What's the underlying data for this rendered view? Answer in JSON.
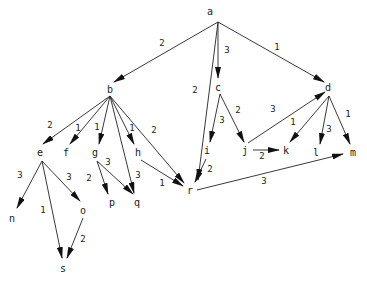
{
  "graph": {
    "type": "directed-weighted-tree",
    "nodes": [
      {
        "id": "a",
        "label": "a",
        "x": 210,
        "y": 12
      },
      {
        "id": "b",
        "label": "b",
        "x": 110,
        "y": 90
      },
      {
        "id": "c",
        "label": "c",
        "x": 218,
        "y": 88
      },
      {
        "id": "d",
        "label": "d",
        "x": 328,
        "y": 88
      },
      {
        "id": "e",
        "label": "e",
        "x": 40,
        "y": 153
      },
      {
        "id": "f",
        "label": "f",
        "x": 66,
        "y": 153
      },
      {
        "id": "g",
        "label": "g",
        "x": 95,
        "y": 153
      },
      {
        "id": "h",
        "label": "h",
        "x": 138,
        "y": 153
      },
      {
        "id": "i",
        "label": "i",
        "x": 207,
        "y": 151
      },
      {
        "id": "j",
        "label": "j",
        "x": 245,
        "y": 151
      },
      {
        "id": "k",
        "label": "k",
        "x": 286,
        "y": 151
      },
      {
        "id": "l",
        "label": "l",
        "x": 316,
        "y": 153
      },
      {
        "id": "m",
        "label": "m",
        "x": 353,
        "y": 153
      },
      {
        "id": "n",
        "label": "n",
        "x": 12,
        "y": 219
      },
      {
        "id": "o",
        "label": "o",
        "x": 83,
        "y": 211
      },
      {
        "id": "p",
        "label": "p",
        "x": 112,
        "y": 203
      },
      {
        "id": "q",
        "label": "q",
        "x": 137,
        "y": 203
      },
      {
        "id": "r",
        "label": "r",
        "x": 190,
        "y": 191
      },
      {
        "id": "s",
        "label": "s",
        "x": 63,
        "y": 269
      }
    ],
    "edges": [
      {
        "from": "a",
        "to": "b",
        "weight": "2",
        "lx": 162,
        "ly": 46,
        "x1": 218,
        "y1": 22,
        "x2": 114,
        "y2": 82
      },
      {
        "from": "a",
        "to": "r",
        "weight": "2",
        "lx": 195,
        "ly": 93,
        "x1": 218,
        "y1": 22,
        "x2": 198,
        "y2": 180
      },
      {
        "from": "a",
        "to": "c",
        "weight": "3",
        "lx": 227,
        "ly": 53,
        "x1": 218,
        "y1": 22,
        "x2": 218,
        "y2": 78
      },
      {
        "from": "a",
        "to": "d",
        "weight": "1",
        "lx": 277,
        "ly": 50,
        "x1": 218,
        "y1": 22,
        "x2": 324,
        "y2": 82
      },
      {
        "from": "b",
        "to": "e",
        "weight": "2",
        "lx": 50,
        "ly": 128,
        "x1": 110,
        "y1": 96,
        "x2": 43,
        "y2": 144
      },
      {
        "from": "b",
        "to": "f",
        "weight": "1",
        "lx": 78,
        "ly": 131,
        "x1": 110,
        "y1": 96,
        "x2": 70,
        "y2": 144
      },
      {
        "from": "b",
        "to": "g",
        "weight": "1",
        "lx": 97,
        "ly": 130,
        "x1": 110,
        "y1": 96,
        "x2": 99,
        "y2": 144
      },
      {
        "from": "b",
        "to": "q",
        "weight": "3",
        "lx": 138,
        "ly": 178,
        "x1": 110,
        "y1": 96,
        "x2": 134,
        "y2": 193
      },
      {
        "from": "b",
        "to": "h",
        "weight": "1",
        "lx": 132,
        "ly": 131,
        "x1": 110,
        "y1": 96,
        "x2": 134,
        "y2": 144
      },
      {
        "from": "b",
        "to": "r",
        "weight": "2",
        "lx": 154,
        "ly": 133,
        "x1": 110,
        "y1": 96,
        "x2": 184,
        "y2": 183
      },
      {
        "from": "c",
        "to": "i",
        "weight": "3",
        "lx": 222,
        "ly": 123,
        "x1": 220,
        "y1": 94,
        "x2": 210,
        "y2": 142
      },
      {
        "from": "c",
        "to": "j",
        "weight": "2",
        "lx": 238,
        "ly": 113,
        "x1": 220,
        "y1": 94,
        "x2": 244,
        "y2": 142
      },
      {
        "from": "d",
        "to": "k",
        "weight": "1",
        "lx": 293,
        "ly": 125,
        "x1": 329,
        "y1": 96,
        "x2": 290,
        "y2": 142
      },
      {
        "from": "d",
        "to": "l",
        "weight": "3",
        "lx": 329,
        "ly": 132,
        "x1": 329,
        "y1": 96,
        "x2": 320,
        "y2": 144
      },
      {
        "from": "d",
        "to": "m",
        "weight": "1",
        "lx": 348,
        "ly": 117,
        "x1": 329,
        "y1": 96,
        "x2": 350,
        "y2": 144
      },
      {
        "from": "j",
        "to": "d",
        "weight": "3",
        "lx": 273,
        "ly": 112,
        "x1": 248,
        "y1": 143,
        "x2": 325,
        "y2": 92
      },
      {
        "from": "j",
        "to": "k",
        "weight": "2",
        "lx": 262,
        "ly": 159,
        "x1": 253,
        "y1": 150,
        "x2": 279,
        "y2": 150
      },
      {
        "from": "e",
        "to": "n",
        "weight": "3",
        "lx": 20,
        "ly": 178,
        "x1": 42,
        "y1": 161,
        "x2": 17,
        "y2": 208
      },
      {
        "from": "e",
        "to": "s",
        "weight": "1",
        "lx": 43,
        "ly": 213,
        "x1": 42,
        "y1": 161,
        "x2": 62,
        "y2": 258
      },
      {
        "from": "e",
        "to": "o",
        "weight": "3",
        "lx": 69,
        "ly": 180,
        "x1": 42,
        "y1": 161,
        "x2": 80,
        "y2": 201
      },
      {
        "from": "o",
        "to": "s",
        "weight": "2",
        "lx": 83,
        "ly": 242,
        "x1": 83,
        "y1": 218,
        "x2": 67,
        "y2": 258
      },
      {
        "from": "g",
        "to": "p",
        "weight": "2",
        "lx": 89,
        "ly": 181,
        "x1": 97,
        "y1": 161,
        "x2": 108,
        "y2": 194
      },
      {
        "from": "g",
        "to": "q",
        "weight": "3",
        "lx": 108,
        "ly": 165,
        "x1": 97,
        "y1": 161,
        "x2": 133,
        "y2": 194
      },
      {
        "from": "h",
        "to": "r",
        "weight": "1",
        "lx": 162,
        "ly": 186,
        "x1": 141,
        "y1": 160,
        "x2": 183,
        "y2": 186
      },
      {
        "from": "i",
        "to": "r",
        "weight": "2",
        "lx": 210,
        "ly": 172,
        "x1": 206,
        "y1": 159,
        "x2": 195,
        "y2": 182
      },
      {
        "from": "r",
        "to": "m",
        "weight": "3",
        "lx": 264,
        "ly": 184,
        "x1": 197,
        "y1": 190,
        "x2": 343,
        "y2": 154
      }
    ]
  }
}
